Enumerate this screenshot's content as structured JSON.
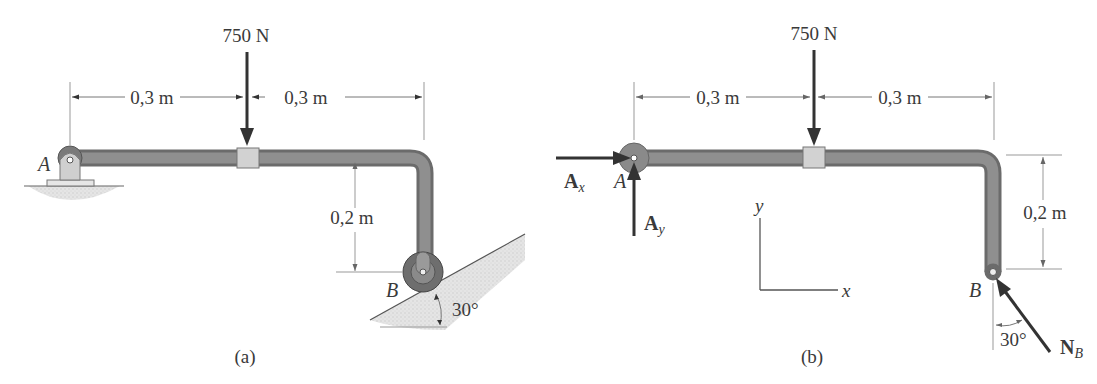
{
  "diagram": {
    "panel_a": {
      "caption": "(a)",
      "load_label": "750 N",
      "dim_left": "0,3 m",
      "dim_right": "0,3 m",
      "dim_vertical": "0,2 m",
      "point_a": "A",
      "point_b": "B",
      "angle": "30°"
    },
    "panel_b": {
      "caption": "(b)",
      "load_label": "750 N",
      "dim_left": "0,3 m",
      "dim_right": "0,3 m",
      "dim_vertical": "0,2 m",
      "point_a": "A",
      "point_b": "B",
      "force_ax": "A",
      "force_ax_sub": "x",
      "force_ay": "A",
      "force_ay_sub": "y",
      "force_nb": "N",
      "force_nb_sub": "B",
      "angle": "30°",
      "axis_x": "x",
      "axis_y": "y"
    },
    "colors": {
      "pipe": "#6b6b6b",
      "force": "#333333",
      "ground": "#d8d8d8"
    }
  }
}
